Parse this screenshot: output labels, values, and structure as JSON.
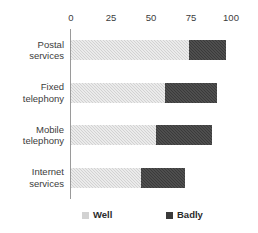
{
  "chart_data": {
    "type": "bar",
    "orientation": "horizontal",
    "stacked": true,
    "title": "",
    "subtitle": "",
    "xlabel": "",
    "ylabel": "",
    "xlim": [
      0,
      100
    ],
    "grid": false,
    "legend_position": "bottom",
    "categories": [
      "Postal services",
      "Fixed telephony",
      "Mobile telephony",
      "Internet services"
    ],
    "category_lines": [
      [
        "Postal",
        "services"
      ],
      [
        "Fixed",
        "telephony"
      ],
      [
        "Mobile",
        "telephony"
      ],
      [
        "Internet",
        "services"
      ]
    ],
    "x_ticks": [
      0,
      25,
      50,
      75,
      100
    ],
    "x_tick_labels": [
      "0",
      "25",
      "50",
      "75",
      "100"
    ],
    "series": [
      {
        "name": "Well",
        "color": "#d2d2d2",
        "values": [
          74,
          59,
          53,
          44
        ]
      },
      {
        "name": "Badly",
        "color": "#3a3a3a",
        "values": [
          23,
          32,
          35,
          27
        ]
      }
    ],
    "totals": [
      97,
      91,
      88,
      71
    ]
  },
  "legend": {
    "items": [
      {
        "label": "Well",
        "swatch": "legend-swatch-well"
      },
      {
        "label": "Badly",
        "swatch": "legend-swatch-badly"
      }
    ]
  },
  "colors": {
    "well": "#d2d2d2",
    "badly": "#3a3a3a",
    "axis": "#9a9a9a",
    "text": "#3c3c3c",
    "background": "#ffffff"
  }
}
